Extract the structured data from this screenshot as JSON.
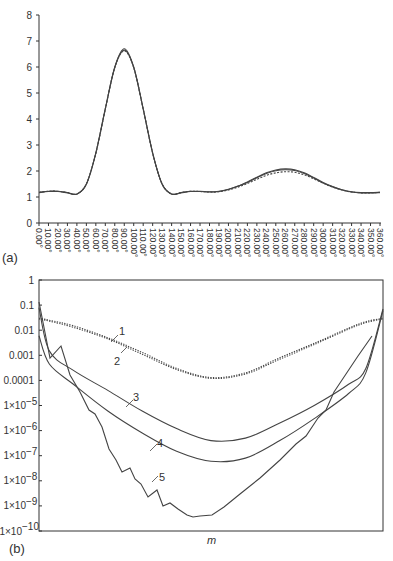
{
  "chart_data": [
    {
      "panel": "(a)",
      "type": "line",
      "title": "",
      "xlabel": "",
      "ylabel": "",
      "ylim": [
        0,
        8
      ],
      "yticks": [
        "0",
        "1",
        "2",
        "3",
        "4",
        "5",
        "6",
        "7",
        "8"
      ],
      "xlim": [
        0,
        360
      ],
      "xticks": [
        "0.00°",
        "10.00°",
        "20.00°",
        "30.00°",
        "40.00°",
        "50.00°",
        "60.00°",
        "70.00°",
        "80.00°",
        "90.00°",
        "100.00°",
        "110.00°",
        "120.00°",
        "130.00°",
        "140.00°",
        "150.00°",
        "160.00°",
        "170.00°",
        "180.00°",
        "190.00°",
        "200.00°",
        "210.00°",
        "220.00°",
        "230.00°",
        "240.00°",
        "250.00°",
        "260.00°",
        "270.00°",
        "280.00°",
        "290.00°",
        "300.00°",
        "310.00°",
        "320.00°",
        "330.00°",
        "340.00°",
        "350.00°",
        "360.00°"
      ],
      "grid": false,
      "legend": null,
      "x": [
        0,
        10,
        20,
        30,
        40,
        50,
        60,
        70,
        80,
        90,
        100,
        110,
        120,
        130,
        140,
        150,
        160,
        170,
        180,
        190,
        200,
        210,
        220,
        230,
        240,
        250,
        260,
        270,
        280,
        290,
        300,
        310,
        320,
        330,
        340,
        350,
        360
      ],
      "series": [
        {
          "name": "solid curve A",
          "style": "solid",
          "values": [
            1.18,
            1.22,
            1.22,
            1.17,
            1.12,
            1.5,
            2.7,
            4.4,
            6.0,
            6.7,
            6.0,
            4.4,
            2.7,
            1.5,
            1.12,
            1.17,
            1.22,
            1.22,
            1.2,
            1.22,
            1.3,
            1.42,
            1.58,
            1.76,
            1.93,
            2.04,
            2.08,
            2.05,
            1.93,
            1.75,
            1.56,
            1.4,
            1.28,
            1.2,
            1.17,
            1.17,
            1.18
          ]
        },
        {
          "name": "solid curve B",
          "style": "solid",
          "values": [
            1.17,
            1.21,
            1.21,
            1.16,
            1.11,
            1.49,
            2.68,
            4.38,
            5.98,
            6.65,
            5.98,
            4.38,
            2.68,
            1.49,
            1.11,
            1.16,
            1.21,
            1.21,
            1.19,
            1.21,
            1.29,
            1.41,
            1.56,
            1.74,
            1.9,
            2.01,
            2.05,
            2.02,
            1.9,
            1.73,
            1.54,
            1.39,
            1.27,
            1.19,
            1.16,
            1.16,
            1.17
          ]
        },
        {
          "name": "dashed curve",
          "style": "dashed",
          "values": [
            1.18,
            1.22,
            1.22,
            1.17,
            1.12,
            1.5,
            2.68,
            4.38,
            5.98,
            6.62,
            5.98,
            4.38,
            2.68,
            1.5,
            1.12,
            1.17,
            1.22,
            1.21,
            1.19,
            1.2,
            1.27,
            1.38,
            1.52,
            1.68,
            1.83,
            1.93,
            1.97,
            1.95,
            1.85,
            1.7,
            1.53,
            1.38,
            1.27,
            1.19,
            1.16,
            1.16,
            1.18
          ]
        }
      ]
    },
    {
      "panel": "(b)",
      "type": "line",
      "title": "",
      "xlabel": "m",
      "ylabel": "",
      "yscale": "log",
      "ylim": [
        1e-10,
        1
      ],
      "yticks": [
        "1",
        "0.1",
        "0.01",
        "0.001",
        "0.0001",
        "1×10⁻⁵",
        "1×10⁻⁶",
        "1×10⁻⁷",
        "1×10⁻⁸",
        "1×10⁻⁹",
        "1×10⁻¹⁰"
      ],
      "grid": false,
      "annotations": [
        "1",
        "2",
        "3",
        "4",
        "5"
      ],
      "x_fraction": [
        0,
        0.03,
        0.1,
        0.2,
        0.3,
        0.4,
        0.5,
        0.6,
        0.7,
        0.8,
        0.9,
        0.95,
        1.0
      ],
      "series": [
        {
          "name": "1",
          "style": "dotted",
          "values": [
            0.03,
            0.025,
            0.015,
            0.005,
            0.0013,
            0.0003,
            0.00013,
            0.0002,
            0.0008,
            0.003,
            0.012,
            0.022,
            0.03
          ]
        },
        {
          "name": "2",
          "style": "dotted",
          "values": [
            0.028,
            0.023,
            0.013,
            0.0045,
            0.0011,
            0.00027,
            0.00012,
            0.00018,
            0.0007,
            0.0027,
            0.011,
            0.02,
            0.028
          ]
        },
        {
          "name": "3",
          "style": "solid",
          "values": [
            0.08,
            0.0015,
            0.00025,
            4e-05,
            6e-06,
            1.2e-06,
            4e-07,
            5e-07,
            2e-06,
            1e-05,
            7e-05,
            0.0003,
            0.07
          ]
        },
        {
          "name": "4",
          "style": "solid",
          "values": [
            0.006,
            0.00045,
            7e-05,
            6e-06,
            8e-07,
            1.5e-07,
            6e-08,
            8e-08,
            4e-07,
            3e-06,
            3e-05,
            0.0002,
            0.06
          ]
        },
        {
          "name": "5",
          "style": "solid",
          "values": [
            0.008,
            5e-05,
            0.00015,
            5e-06,
            2e-07,
            1e-08,
            1.5e-09,
            5e-10,
            1e-09,
            2e-08,
            5e-07,
            4e-06,
            6e-05
          ]
        }
      ]
    }
  ],
  "labels": {
    "panel_a": "(a)",
    "panel_b": "(b)",
    "xlabel_b": "m",
    "ann1": "1",
    "ann2": "2",
    "ann3": "3",
    "ann4": "4",
    "ann5": "5",
    "yticks_a": [
      "0",
      "1",
      "2",
      "3",
      "4",
      "5",
      "6",
      "7",
      "8"
    ],
    "yticks_b": [
      "1",
      "0.1",
      "0.01",
      "0.001",
      "0.0001",
      "1×10",
      "1×10",
      "1×10",
      "1×10",
      "1×10",
      "1×10"
    ],
    "yexp_b": [
      "",
      "",
      "",
      "",
      "",
      "−5",
      "−6",
      "−7",
      "−8",
      "−9",
      "−10"
    ]
  }
}
